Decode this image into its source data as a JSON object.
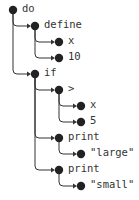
{
  "diagram": {
    "type": "syntax-tree",
    "colors": {
      "node": "#222222",
      "edge": "#333333",
      "text": "#333333"
    },
    "nodes": [
      {
        "id": "n0",
        "label": "do",
        "x": 13,
        "y": 10,
        "parent": null
      },
      {
        "id": "n1",
        "label": "define",
        "x": 35,
        "y": 26,
        "parent": "n0"
      },
      {
        "id": "n2",
        "label": "x",
        "x": 59,
        "y": 42,
        "parent": "n1"
      },
      {
        "id": "n3",
        "label": "10",
        "x": 59,
        "y": 58,
        "parent": "n1"
      },
      {
        "id": "n4",
        "label": "if",
        "x": 35,
        "y": 74,
        "parent": "n0"
      },
      {
        "id": "n5",
        "label": ">",
        "x": 59,
        "y": 90,
        "parent": "n4"
      },
      {
        "id": "n6",
        "label": "x",
        "x": 81,
        "y": 106,
        "parent": "n5"
      },
      {
        "id": "n7",
        "label": "5",
        "x": 81,
        "y": 122,
        "parent": "n5"
      },
      {
        "id": "n8",
        "label": "print",
        "x": 59,
        "y": 138,
        "parent": "n4"
      },
      {
        "id": "n9",
        "label": "\"large\"",
        "x": 81,
        "y": 154,
        "parent": "n8"
      },
      {
        "id": "n10",
        "label": "print",
        "x": 59,
        "y": 170,
        "parent": "n4"
      },
      {
        "id": "n11",
        "label": "\"small\"",
        "x": 81,
        "y": 186,
        "parent": "n10"
      }
    ]
  }
}
